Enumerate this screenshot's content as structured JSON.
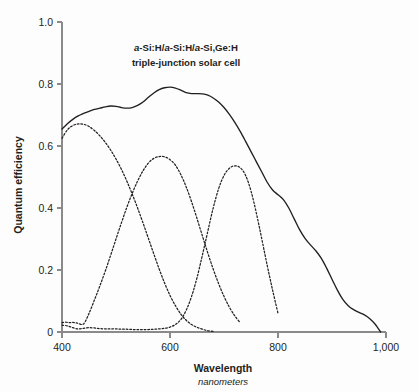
{
  "chart_data": {
    "type": "line",
    "title": "a-Si:H/a-Si:H/a-Si,Ge:H triple-junction solar cell",
    "title_lines": [
      "a-Si:H/a-Si:H/a-Si,Ge:H",
      "triple-junction solar cell"
    ],
    "xlabel": "Wavelength",
    "xlabel_sub": "nanometers",
    "ylabel": "Quantum efficiency",
    "xlim": [
      400,
      1000
    ],
    "ylim": [
      0,
      1.0
    ],
    "xticks": [
      400,
      600,
      800,
      1000
    ],
    "xtick_labels": [
      "400",
      "600",
      "800",
      "1,000"
    ],
    "yticks": [
      0,
      0.2,
      0.4,
      0.6,
      0.8,
      1.0
    ],
    "ytick_labels": [
      "0",
      "0.2",
      "0.4",
      "0.6",
      "0.8",
      "1.0"
    ],
    "grid": false,
    "legend": "none",
    "line_color": "#231f20",
    "series": [
      {
        "name": "total",
        "style": "solid",
        "x": [
          400,
          410,
          420,
          430,
          440,
          450,
          460,
          470,
          480,
          490,
          500,
          510,
          520,
          530,
          540,
          550,
          560,
          570,
          580,
          590,
          600,
          610,
          620,
          630,
          640,
          650,
          660,
          670,
          680,
          690,
          700,
          710,
          720,
          730,
          740,
          750,
          760,
          770,
          780,
          790,
          800,
          810,
          820,
          830,
          840,
          850,
          860,
          870,
          880,
          890,
          900,
          910,
          920,
          930,
          940,
          950,
          960,
          970,
          980,
          990
        ],
        "y": [
          0.655,
          0.672,
          0.686,
          0.697,
          0.705,
          0.712,
          0.718,
          0.722,
          0.726,
          0.729,
          0.728,
          0.724,
          0.722,
          0.724,
          0.731,
          0.742,
          0.757,
          0.771,
          0.782,
          0.788,
          0.79,
          0.787,
          0.78,
          0.772,
          0.769,
          0.769,
          0.768,
          0.764,
          0.755,
          0.742,
          0.724,
          0.702,
          0.676,
          0.647,
          0.615,
          0.582,
          0.549,
          0.516,
          0.483,
          0.458,
          0.443,
          0.427,
          0.4,
          0.365,
          0.33,
          0.302,
          0.281,
          0.262,
          0.238,
          0.206,
          0.17,
          0.135,
          0.105,
          0.085,
          0.072,
          0.063,
          0.055,
          0.043,
          0.025,
          0.0
        ]
      },
      {
        "name": "top-cell",
        "style": "dotted",
        "x": [
          400,
          410,
          420,
          430,
          440,
          450,
          460,
          470,
          480,
          490,
          500,
          510,
          520,
          530,
          540,
          550,
          560,
          570,
          580,
          590,
          600,
          610,
          620,
          630,
          640,
          650,
          660,
          670,
          680
        ],
        "y": [
          0.625,
          0.652,
          0.666,
          0.671,
          0.67,
          0.663,
          0.65,
          0.633,
          0.612,
          0.587,
          0.558,
          0.525,
          0.487,
          0.445,
          0.4,
          0.352,
          0.302,
          0.252,
          0.203,
          0.158,
          0.118,
          0.085,
          0.058,
          0.038,
          0.024,
          0.015,
          0.009,
          0.004,
          0.002
        ]
      },
      {
        "name": "middle-cell",
        "style": "dotted",
        "x": [
          400,
          405,
          410,
          415,
          420,
          425,
          430,
          440,
          450,
          460,
          470,
          480,
          490,
          500,
          510,
          520,
          530,
          540,
          550,
          560,
          570,
          580,
          590,
          600,
          610,
          620,
          630,
          640,
          650,
          660,
          670,
          680,
          690,
          700,
          710,
          720,
          730
        ],
        "y": [
          0.03,
          0.032,
          0.031,
          0.03,
          0.031,
          0.03,
          0.028,
          0.026,
          0.06,
          0.103,
          0.148,
          0.196,
          0.247,
          0.3,
          0.352,
          0.402,
          0.447,
          0.487,
          0.52,
          0.545,
          0.56,
          0.566,
          0.565,
          0.556,
          0.538,
          0.508,
          0.468,
          0.42,
          0.366,
          0.31,
          0.255,
          0.203,
          0.156,
          0.115,
          0.08,
          0.052,
          0.03
        ]
      },
      {
        "name": "bottom-cell",
        "style": "dotted",
        "x": [
          400,
          410,
          420,
          430,
          440,
          450,
          460,
          470,
          480,
          490,
          500,
          510,
          520,
          530,
          540,
          550,
          560,
          570,
          580,
          590,
          600,
          610,
          620,
          630,
          640,
          650,
          660,
          670,
          680,
          690,
          700,
          710,
          720,
          730,
          740,
          750,
          760,
          770,
          780,
          790,
          800
        ],
        "y": [
          0.022,
          0.02,
          0.014,
          0.01,
          0.012,
          0.014,
          0.013,
          0.011,
          0.01,
          0.01,
          0.01,
          0.009,
          0.009,
          0.008,
          0.008,
          0.008,
          0.008,
          0.009,
          0.01,
          0.012,
          0.016,
          0.024,
          0.04,
          0.07,
          0.115,
          0.175,
          0.248,
          0.325,
          0.4,
          0.462,
          0.505,
          0.528,
          0.536,
          0.53,
          0.505,
          0.455,
          0.383,
          0.3,
          0.215,
          0.135,
          0.06
        ]
      }
    ]
  }
}
